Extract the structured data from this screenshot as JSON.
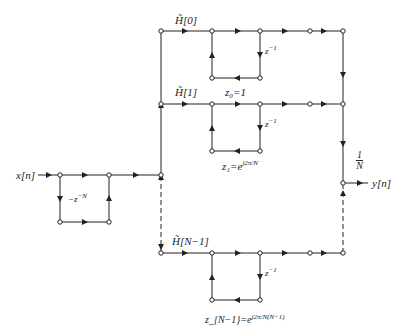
{
  "diagram": {
    "type": "signal-flow-graph",
    "input": {
      "label": "x[n]",
      "comb_gain": "−z^{-N}",
      "comb_gain_text": "−z",
      "comb_gain_sup": "−N"
    },
    "output": {
      "label": "y[n]",
      "gain_num": "1",
      "gain_den": "N"
    },
    "branches": [
      {
        "coef": "H̃[0]",
        "pole_label": "z₀=1",
        "delay": "z",
        "delay_sup": "−1"
      },
      {
        "coef": "H̃[1]",
        "pole_label": "z₁=e",
        "pole_sup": "j2π/N",
        "delay": "z",
        "delay_sup": "−1"
      },
      {
        "coef": "H̃[N−1]",
        "pole_label": "z_{N−1}=e",
        "pole_sup": "j2π/N(N−1)",
        "delay": "z",
        "delay_sup": "−1"
      }
    ],
    "colors": {
      "line": "#222222",
      "node_fill": "#ffffff"
    }
  }
}
